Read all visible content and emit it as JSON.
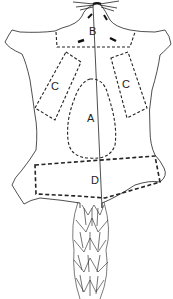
{
  "diagram": {
    "regions": {
      "a": "A",
      "b": "B",
      "c_left": "C",
      "c_right": "C",
      "d": "D"
    }
  }
}
